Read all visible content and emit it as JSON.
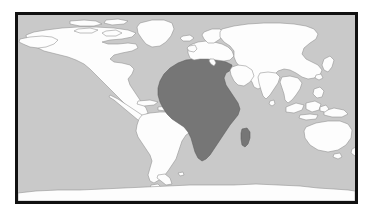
{
  "figure": {
    "kind": "world-map",
    "projection": "equirectangular",
    "title": "",
    "caption": ""
  },
  "colors": {
    "page_background": "#ffffff",
    "frame_border": "#111111",
    "ocean": "#c9c9c9",
    "land_default": "#fdfdfd",
    "land_outline": "#8e8e8e",
    "land_highlight": "#767676",
    "land_highlight_outline": "#5a5a5a"
  },
  "frame": {
    "x": 15,
    "y": 12,
    "width": 343,
    "height": 192,
    "border_width": 3
  },
  "legend": {
    "visible": false,
    "entries": [
      {
        "label": "Highlighted region",
        "color": "#767676"
      },
      {
        "label": "Other land",
        "color": "#fdfdfd"
      },
      {
        "label": "Ocean",
        "color": "#c9c9c9"
      }
    ]
  },
  "regions": [
    {
      "name": "Africa",
      "highlighted": true
    },
    {
      "name": "Madagascar",
      "highlighted": true
    },
    {
      "name": "North America",
      "highlighted": false
    },
    {
      "name": "South America",
      "highlighted": false
    },
    {
      "name": "Greenland",
      "highlighted": false
    },
    {
      "name": "Europe",
      "highlighted": false
    },
    {
      "name": "Asia",
      "highlighted": false
    },
    {
      "name": "Arabian Peninsula",
      "highlighted": false
    },
    {
      "name": "India",
      "highlighted": false
    },
    {
      "name": "Southeast Asia",
      "highlighted": false
    },
    {
      "name": "Japan",
      "highlighted": false
    },
    {
      "name": "Australia",
      "highlighted": false
    },
    {
      "name": "New Zealand",
      "highlighted": false
    },
    {
      "name": "Antarctica",
      "highlighted": false
    },
    {
      "name": "Iceland",
      "highlighted": false
    },
    {
      "name": "British Isles",
      "highlighted": false
    },
    {
      "name": "Caribbean",
      "highlighted": false
    },
    {
      "name": "Sri Lanka",
      "highlighted": false
    }
  ]
}
